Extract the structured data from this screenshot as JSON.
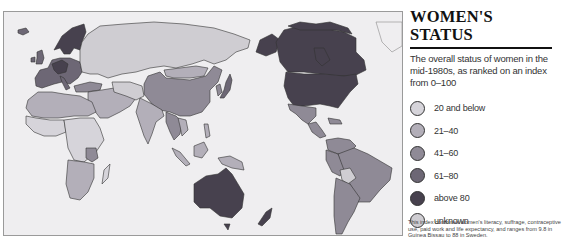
{
  "title": "WOMEN'S STATUS",
  "subtitle": "The overall status of women in the mid-1980s, as ranked on an index from 0–100",
  "colors": {
    "map_background": "#efeef0",
    "band_20_below": "#d6d4da",
    "band_21_40": "#b3afb9",
    "band_41_60": "#8f8a96",
    "band_61_80": "#6d6775",
    "band_above_80": "#47414e",
    "unknown": "#cfcdd2"
  },
  "legend": [
    {
      "label": "20 and below",
      "color": "#d6d4da"
    },
    {
      "label": "21–40",
      "color": "#b3afb9"
    },
    {
      "label": "41–60",
      "color": "#8f8a96"
    },
    {
      "label": "61–80",
      "color": "#6d6775"
    },
    {
      "label": "above 80",
      "color": "#47414e"
    },
    {
      "label": "unknown",
      "color": "#cfcdd2"
    }
  ],
  "footnote": "This index combines women's literacy, suffrage, contraceptive use, paid work and life expectancy, and ranges from 9.8 in Guinea Bissau to 88 in Sweden.",
  "map": {
    "projection": "Pacific-centered world map",
    "regions": [
      {
        "name": "Scandinavia",
        "band": "above 80"
      },
      {
        "name": "Western Europe",
        "band": "61–80"
      },
      {
        "name": "Eastern Europe",
        "band": "61–80"
      },
      {
        "name": "Soviet Union",
        "band": "21–40"
      },
      {
        "name": "China",
        "band": "41–60"
      },
      {
        "name": "Mongolia",
        "band": "21–40"
      },
      {
        "name": "Japan",
        "band": "61–80"
      },
      {
        "name": "India",
        "band": "21–40"
      },
      {
        "name": "Middle East",
        "band": "21–40"
      },
      {
        "name": "Africa",
        "band": "20 and below / 21–40"
      },
      {
        "name": "Southeast Asia",
        "band": "21–40 / 41–60"
      },
      {
        "name": "Australia",
        "band": "above 80"
      },
      {
        "name": "New Zealand",
        "band": "above 80"
      },
      {
        "name": "Canada",
        "band": "above 80"
      },
      {
        "name": "United States",
        "band": "above 80"
      },
      {
        "name": "Mexico",
        "band": "41–60"
      },
      {
        "name": "South America",
        "band": "41–60"
      },
      {
        "name": "Bolivia",
        "band": "21–40"
      }
    ]
  }
}
